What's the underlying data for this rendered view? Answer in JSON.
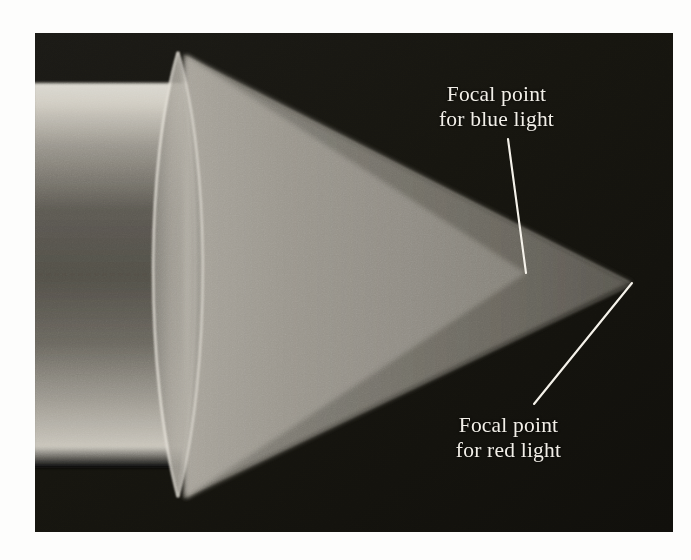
{
  "figure": {
    "kind": "photograph-diagram",
    "border_color": "#fdfdfc",
    "plate_background_color": "#14130f"
  },
  "annotations": [
    {
      "id": "blue-focal-callout",
      "line1": "Focal point",
      "line2": "for blue light",
      "text_color": "#f2efe8",
      "leader": {
        "from_x": 508,
        "from_y": 139,
        "to_x": 526,
        "to_y": 273
      }
    },
    {
      "id": "red-focal-callout",
      "line1": "Focal point",
      "line2": "for red light",
      "text_color": "#f2efe8",
      "leader": {
        "from_x": 628,
        "from_y": 283,
        "to_x": 534,
        "to_y": 404
      }
    }
  ],
  "optics": {
    "incoming_beam": {
      "label": "collimated-white-light-beam",
      "top_y": 83,
      "bottom_y": 468,
      "left_x": 35,
      "right_x": 205,
      "highlight_color": "#d8d4ca",
      "core_color": "#4e4c46"
    },
    "lens": {
      "label": "biconvex-converging-lens",
      "top_vertex": {
        "x": 178,
        "y": 52
      },
      "bottom_vertex": {
        "x": 178,
        "y": 497
      },
      "half_width": 34,
      "glass_color": "#9d9991",
      "rim_highlight_color": "#e8e4db"
    },
    "blue_cone": {
      "label": "blue-light-converging-cone",
      "apex": {
        "x": 526,
        "y": 272
      },
      "fill_color": "#8e8b83"
    },
    "red_cone": {
      "label": "red-light-converging-cone",
      "apex": {
        "x": 632,
        "y": 283
      },
      "fill_color": "#6b6860"
    }
  }
}
